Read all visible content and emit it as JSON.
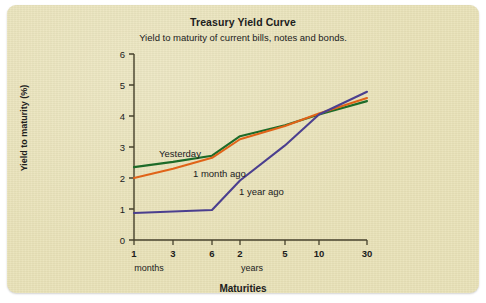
{
  "chart_data": {
    "type": "line",
    "title": "Treasury Yield Curve",
    "subtitle": "Yield to maturity of current bills, notes and bonds.",
    "xlabel": "Maturities",
    "ylabel": "Yield to maturity (%)",
    "x_tick_labels": [
      "1",
      "3",
      "6",
      "2",
      "5",
      "10",
      "30"
    ],
    "x_group_labels": [
      "months",
      "years"
    ],
    "y_tick_labels": [
      "0",
      "1",
      "2",
      "3",
      "4",
      "5",
      "6"
    ],
    "ylim": [
      0,
      6
    ],
    "grid": false,
    "legend": "inline-annotations",
    "categories": [
      "1 month",
      "3 months",
      "6 months",
      "2 years",
      "5 years",
      "10 years",
      "30 years"
    ],
    "series": [
      {
        "name": "Yesterday",
        "color": "#1d6b29",
        "values": [
          2.35,
          2.52,
          2.72,
          3.35,
          3.7,
          4.05,
          4.48
        ]
      },
      {
        "name": "1 month ago",
        "color": "#e06318",
        "values": [
          2.0,
          2.3,
          2.65,
          3.25,
          3.68,
          4.08,
          4.58
        ]
      },
      {
        "name": "1 year ago",
        "color": "#4b3f8f",
        "values": [
          0.87,
          0.92,
          0.97,
          1.92,
          3.05,
          4.05,
          4.78
        ]
      }
    ],
    "annotations": [
      {
        "text": "Yesterday",
        "x": 152,
        "y": 152
      },
      {
        "text": "1 month ago",
        "x": 186,
        "y": 172
      },
      {
        "text": "1 year ago",
        "x": 232,
        "y": 190
      }
    ]
  }
}
